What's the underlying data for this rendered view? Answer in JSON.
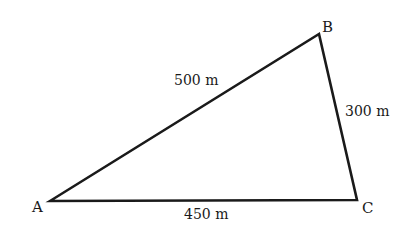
{
  "figure": {
    "type": "triangle",
    "stroke_color": "#1a1a1a",
    "vertices": [
      {
        "id": "A",
        "label": "A",
        "x": 50,
        "y": 201
      },
      {
        "id": "B",
        "label": "B",
        "x": 319,
        "y": 34
      },
      {
        "id": "C",
        "label": "C",
        "x": 357,
        "y": 200
      }
    ],
    "sides": [
      {
        "from": "A",
        "to": "B",
        "label": "500 m"
      },
      {
        "from": "B",
        "to": "C",
        "label": "300 m"
      },
      {
        "from": "A",
        "to": "C",
        "label": "450 m"
      }
    ]
  }
}
